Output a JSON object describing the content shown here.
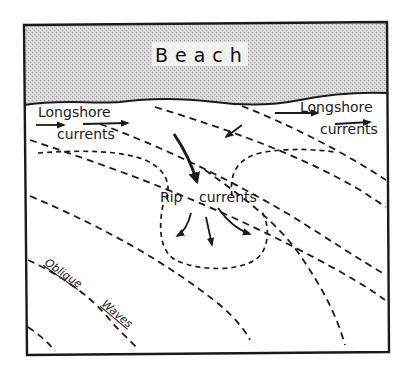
{
  "diagram": {
    "title_region": "Beach",
    "labels": {
      "beach": "Beach",
      "longshore_left_1": "Longshore",
      "longshore_left_2": "currents",
      "longshore_right_1": "Longshore",
      "longshore_right_2": "currents",
      "rip_1": "Rip",
      "rip_2": "currents",
      "oblique": "Oblique",
      "waves": "Waves"
    },
    "colors": {
      "ink": "#1a1a1a",
      "beach_fill": "#cfcfcf",
      "water": "#ffffff"
    }
  }
}
